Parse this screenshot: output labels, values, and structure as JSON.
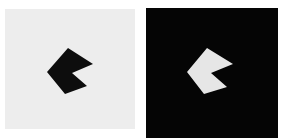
{
  "panels": [
    {
      "name": "light-panel",
      "background": "#ededed",
      "shape_color": "#0d0d0d",
      "shape_points": "68,48 93,64 72,73 87,86 65,94 47,72"
    },
    {
      "name": "dark-panel",
      "background": "#050505",
      "shape_color": "#e6e6e6",
      "shape_points": "207,48 233,64 211,73 227,87 204,94 187,72"
    }
  ]
}
